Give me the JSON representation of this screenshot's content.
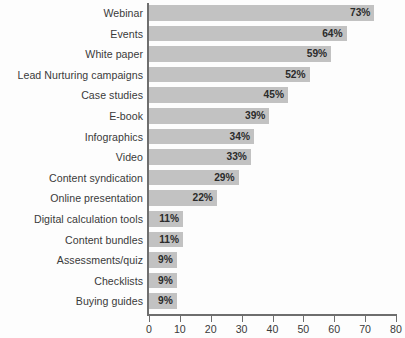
{
  "chart_data": {
    "type": "bar",
    "orientation": "horizontal",
    "title": "",
    "subtitle": "",
    "xlabel": "",
    "ylabel": "",
    "xlim": [
      0,
      80
    ],
    "grid": false,
    "legend": null,
    "value_suffix": "%",
    "categories": [
      "Webinar",
      "Events",
      "White paper",
      "Lead Nurturing campaigns",
      "Case studies",
      "E-book",
      "Infographics",
      "Video",
      "Content syndication",
      "Online presentation",
      "Digital calculation tools",
      "Content bundles",
      "Assessments/quiz",
      "Checklists",
      "Buying guides"
    ],
    "values": [
      73,
      64,
      59,
      52,
      45,
      39,
      34,
      33,
      29,
      22,
      11,
      11,
      9,
      9,
      9
    ],
    "value_labels": [
      "73%",
      "64%",
      "59%",
      "52%",
      "45%",
      "39%",
      "34%",
      "33%",
      "29%",
      "22%",
      "11%",
      "11%",
      "9%",
      "9%",
      "9%"
    ],
    "xticks": [
      0,
      10,
      20,
      30,
      40,
      50,
      60,
      70,
      80
    ],
    "xtick_labels": [
      "0",
      "10",
      "20",
      "30",
      "40",
      "50",
      "60",
      "70",
      "80"
    ],
    "colors": {
      "bar_fill": "#c2c2c2",
      "axis": "#6e6e6e",
      "label_text": "#3a3a3a",
      "value_text": "#2b2b2b",
      "background": "#fdfdfd"
    }
  }
}
